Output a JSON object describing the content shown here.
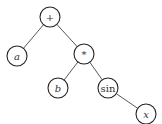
{
  "diagram": {
    "type": "expression-tree",
    "expression": "a + b * sin(x)",
    "nodes": [
      {
        "id": "plus",
        "label": "+",
        "italic": false,
        "x": 50,
        "y": 17,
        "r": 10
      },
      {
        "id": "a",
        "label": "a",
        "italic": true,
        "x": 17,
        "y": 56,
        "r": 10
      },
      {
        "id": "times",
        "label": "*",
        "italic": false,
        "x": 84,
        "y": 54,
        "r": 10
      },
      {
        "id": "b",
        "label": "b",
        "italic": true,
        "x": 58,
        "y": 88,
        "r": 10
      },
      {
        "id": "sin",
        "label": "sin",
        "italic": false,
        "x": 108,
        "y": 88,
        "r": 10
      },
      {
        "id": "x",
        "label": "x",
        "italic": true,
        "x": 146,
        "y": 114,
        "r": 10
      }
    ],
    "edges": [
      {
        "from": "plus",
        "to": "a"
      },
      {
        "from": "plus",
        "to": "times"
      },
      {
        "from": "times",
        "to": "b"
      },
      {
        "from": "times",
        "to": "sin"
      },
      {
        "from": "sin",
        "to": "x"
      }
    ]
  }
}
